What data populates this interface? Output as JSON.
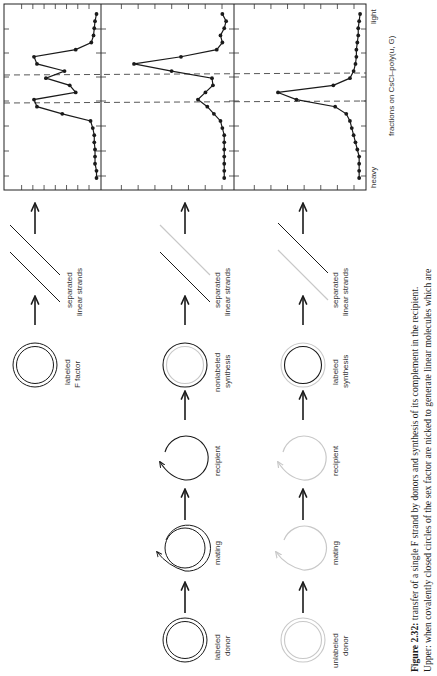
{
  "figure": {
    "number": "Figure 2.32:",
    "caption_line1": "transfer of a single F strand by donors and synthesis of its complement in the recipient.",
    "caption_line2": "Upper: when covalently closed circles of the sex factor are nicked to generate linear molecules which are"
  },
  "rows": [
    {
      "steps": [
        {
          "label1": "labeled",
          "label2": "F factor"
        },
        {
          "label1": "separated",
          "label2": "linear strands"
        }
      ]
    },
    {
      "steps": [
        {
          "label1": "labeled",
          "label2": "donor"
        },
        {
          "label1": "mating",
          "label2": ""
        },
        {
          "label1": "recipient",
          "label2": ""
        },
        {
          "label1": "nonlabeled",
          "label2": "synthesis"
        },
        {
          "label1": "separated",
          "label2": "linear strands"
        }
      ]
    },
    {
      "steps": [
        {
          "label1": "unlabeled",
          "label2": "donor"
        },
        {
          "label1": "mating",
          "label2": ""
        },
        {
          "label1": "recipient",
          "label2": ""
        },
        {
          "label1": "labeled",
          "label2": "synthesis"
        },
        {
          "label1": "separated",
          "label2": "linear strands"
        }
      ]
    }
  ],
  "axis": {
    "xlabel": "fractions on CsCl–poly(u, G)",
    "heavy": "heavy",
    "light": "light"
  },
  "colors": {
    "labeled": "#1a1a1a",
    "unlabeled": "#c8c8c8"
  },
  "chart_data": [
    {
      "type": "line",
      "title": "labeled F factor, separated linear strands",
      "xlabel": "fractions on CsCl–poly(u, G) (heavy → light)",
      "ylabel": "radioactivity (arbitrary)",
      "x": [
        1,
        2,
        3,
        4,
        5,
        6,
        7,
        8,
        9,
        10,
        11,
        12,
        13,
        14,
        15,
        16,
        17,
        18,
        19,
        20,
        21,
        22,
        23,
        24
      ],
      "values": [
        2,
        2,
        4,
        4,
        4,
        5,
        5,
        7,
        10,
        48,
        82,
        86,
        30,
        38,
        70,
        45,
        82,
        86,
        30,
        9,
        6,
        5,
        4,
        2
      ],
      "dashed_markers_at_fraction": [
        12.5,
        17.5
      ],
      "grid": false
    },
    {
      "type": "line",
      "title": "labeled donor, nonlabeled synthesis",
      "xlabel": "fractions on CsCl–poly(u, G) (heavy → light)",
      "ylabel": "radioactivity (arbitrary)",
      "x": [
        1,
        2,
        3,
        4,
        5,
        6,
        7,
        8,
        9,
        10,
        11,
        12,
        13,
        14,
        15,
        16,
        17,
        18,
        19,
        20,
        21,
        22,
        23,
        24
      ],
      "values": [
        4,
        4,
        4,
        4,
        4,
        4,
        4,
        6,
        8,
        15,
        22,
        32,
        24,
        16,
        17,
        60,
        100,
        50,
        12,
        6,
        8,
        4,
        2,
        6
      ],
      "dashed_markers_at_fraction": [
        13,
        17.5
      ],
      "grid": false
    },
    {
      "type": "line",
      "title": "unlabeled donor, labeled synthesis",
      "xlabel": "fractions on CsCl–poly(u, G) (heavy → light)",
      "ylabel": "radioactivity (arbitrary)",
      "x": [
        1,
        2,
        3,
        4,
        5,
        6,
        7,
        8,
        9,
        10,
        11,
        12,
        13,
        14,
        15,
        16,
        17,
        18,
        19,
        20,
        21,
        22,
        23,
        24
      ],
      "values": [
        2,
        2,
        2,
        2,
        4,
        6,
        8,
        10,
        12,
        16,
        28,
        70,
        90,
        30,
        12,
        8,
        6,
        5,
        5,
        4,
        3,
        3,
        2,
        1
      ],
      "dashed_markers_at_fraction": [
        13,
        17.5
      ],
      "grid": false
    }
  ]
}
